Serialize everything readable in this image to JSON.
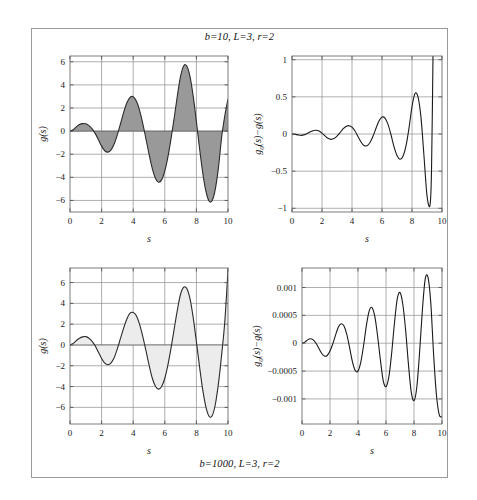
{
  "figure": {
    "title_top": "b=10, L=3, r=2",
    "title_bottom": "b=1000, L=3, r=2",
    "background": "#ffffff",
    "frame_color": "#9a9a9a"
  },
  "chart_data": [
    {
      "id": "top-left",
      "type": "area",
      "title": "b=10, L=3, r=2",
      "xlabel": "s",
      "ylabel": "g(s)",
      "xlim": [
        0,
        10
      ],
      "ylim": [
        -7,
        6.5
      ],
      "xticks": [
        0,
        2,
        4,
        6,
        8,
        10
      ],
      "yticks": [
        -6,
        -4,
        -2,
        0,
        2,
        4,
        6
      ],
      "xticklabels": [
        "0",
        "2",
        "4",
        "6",
        "8",
        "10"
      ],
      "yticklabels": [
        "-6",
        "-4",
        "-2",
        "0",
        "2",
        "4",
        "6"
      ],
      "grid": true,
      "fill_color": "#999999",
      "line_color": "#2b2b2b",
      "baseline": 0,
      "x": [
        0.0,
        0.2,
        0.4,
        0.6,
        0.8,
        1.0,
        1.2,
        1.4,
        1.6,
        1.8,
        2.0,
        2.2,
        2.4,
        2.6,
        2.8,
        3.0,
        3.2,
        3.4,
        3.6,
        3.8,
        4.0,
        4.2,
        4.4,
        4.6,
        4.8,
        5.0,
        5.2,
        5.4,
        5.6,
        5.8,
        6.0,
        6.2,
        6.4,
        6.6,
        6.8,
        7.0,
        7.2,
        7.4,
        7.6,
        7.8,
        8.0,
        8.2,
        8.4,
        8.6,
        8.8,
        9.0,
        9.2,
        9.4,
        9.6,
        9.8,
        10.0
      ],
      "y": [
        0.0,
        0.12,
        0.37,
        0.57,
        0.65,
        0.63,
        0.47,
        0.19,
        -0.22,
        -0.75,
        -1.3,
        -1.7,
        -1.82,
        -1.62,
        -1.1,
        -0.3,
        0.66,
        1.64,
        2.45,
        2.92,
        2.98,
        2.6,
        1.82,
        0.7,
        -0.62,
        -1.98,
        -3.2,
        -4.05,
        -4.42,
        -4.22,
        -3.45,
        -2.2,
        -0.6,
        1.2,
        3.1,
        4.75,
        5.65,
        5.62,
        4.7,
        3.0,
        0.82,
        -1.5,
        -3.6,
        -5.2,
        -6.05,
        -6.0,
        -5.0,
        -3.1,
        -0.5,
        1.35,
        2.78
      ]
    },
    {
      "id": "top-right",
      "type": "line",
      "title": "b=10, L=3, r=2",
      "xlabel": "s",
      "ylabel": "g0(s)-g(s)",
      "ylabel_parts": {
        "g": "g",
        "sub": "0",
        "rest": "(s)-g(s)"
      },
      "xlim": [
        0,
        10
      ],
      "ylim": [
        -1.05,
        1.05
      ],
      "xticks": [
        0,
        2,
        4,
        6,
        8,
        10
      ],
      "yticks": [
        -1,
        -0.5,
        0,
        0.5,
        1
      ],
      "xticklabels": [
        "0",
        "2",
        "4",
        "6",
        "8",
        "10"
      ],
      "yticklabels": [
        "-1",
        "-0.5",
        "0",
        "0.5",
        "1"
      ],
      "grid": true,
      "line_color": "#1a1a1a",
      "x": [
        0.0,
        0.2,
        0.4,
        0.6,
        0.8,
        1.0,
        1.2,
        1.4,
        1.6,
        1.8,
        2.0,
        2.2,
        2.4,
        2.6,
        2.8,
        3.0,
        3.2,
        3.4,
        3.6,
        3.8,
        4.0,
        4.2,
        4.4,
        4.6,
        4.8,
        5.0,
        5.2,
        5.4,
        5.6,
        5.8,
        6.0,
        6.2,
        6.4,
        6.6,
        6.8,
        7.0,
        7.2,
        7.4,
        7.6,
        7.8,
        8.0,
        8.2,
        8.4,
        8.6,
        8.8,
        9.0,
        9.2,
        9.3,
        9.4
      ],
      "y": [
        0.0,
        -0.004,
        -0.012,
        -0.018,
        -0.012,
        0.006,
        0.028,
        0.045,
        0.05,
        0.04,
        0.012,
        -0.025,
        -0.058,
        -0.072,
        -0.062,
        -0.03,
        0.018,
        0.068,
        0.102,
        0.112,
        0.092,
        0.04,
        -0.035,
        -0.108,
        -0.155,
        -0.158,
        -0.115,
        -0.03,
        0.078,
        0.175,
        0.228,
        0.215,
        0.13,
        -0.01,
        -0.17,
        -0.29,
        -0.34,
        -0.3,
        -0.16,
        0.08,
        0.37,
        0.545,
        0.5,
        0.22,
        -0.3,
        -0.83,
        -0.96,
        -0.5,
        1.05
      ]
    },
    {
      "id": "bottom-left",
      "type": "area",
      "title": "b=1000, L=3, r=2",
      "xlabel": "s",
      "ylabel": "g(s)",
      "xlim": [
        0,
        10
      ],
      "ylim": [
        -7.6,
        7.4
      ],
      "xticks": [
        0,
        2,
        4,
        6,
        8,
        10
      ],
      "yticks": [
        -6,
        -4,
        -2,
        0,
        2,
        4,
        6
      ],
      "xticklabels": [
        "0",
        "2",
        "4",
        "6",
        "8",
        "10"
      ],
      "yticklabels": [
        "-6",
        "-4",
        "-2",
        "0",
        "2",
        "4",
        "6"
      ],
      "grid": true,
      "fill_color": "#ececec",
      "line_color": "#2b2b2b",
      "baseline": 0,
      "x": [
        0.0,
        0.2,
        0.4,
        0.6,
        0.8,
        1.0,
        1.2,
        1.4,
        1.6,
        1.8,
        2.0,
        2.2,
        2.4,
        2.6,
        2.8,
        3.0,
        3.2,
        3.4,
        3.6,
        3.8,
        4.0,
        4.2,
        4.4,
        4.6,
        4.8,
        5.0,
        5.2,
        5.4,
        5.6,
        5.8,
        6.0,
        6.2,
        6.4,
        6.6,
        6.8,
        7.0,
        7.2,
        7.4,
        7.6,
        7.8,
        8.0,
        8.2,
        8.4,
        8.6,
        8.8,
        9.0,
        9.2,
        9.4,
        9.6,
        9.8,
        10.0
      ],
      "y": [
        0.0,
        0.15,
        0.42,
        0.65,
        0.78,
        0.8,
        0.65,
        0.35,
        -0.1,
        -0.7,
        -1.3,
        -1.75,
        -1.9,
        -1.72,
        -1.2,
        -0.35,
        0.65,
        1.65,
        2.5,
        3.05,
        3.13,
        2.8,
        2.0,
        0.85,
        -0.5,
        -1.9,
        -3.15,
        -3.95,
        -4.25,
        -4.0,
        -3.2,
        -1.9,
        -0.25,
        1.6,
        3.4,
        4.9,
        5.55,
        5.4,
        4.4,
        2.6,
        0.3,
        -2.1,
        -4.3,
        -5.95,
        -6.85,
        -6.8,
        -5.7,
        -3.65,
        -0.9,
        2.3,
        7.2
      ]
    },
    {
      "id": "bottom-right",
      "type": "line",
      "title": "b=1000, L=3, r=2",
      "xlabel": "s",
      "ylabel": "g0(s)-g(s)",
      "ylabel_parts": {
        "g": "g",
        "sub": "0",
        "rest": "(s)-g(s)"
      },
      "xlim": [
        0,
        10
      ],
      "ylim": [
        -0.00145,
        0.00135
      ],
      "xticks": [
        0,
        2,
        4,
        6,
        8,
        10
      ],
      "yticks": [
        -0.001,
        -0.0005,
        0,
        0.0005,
        0.001
      ],
      "xticklabels": [
        "0",
        "2",
        "4",
        "6",
        "8",
        "10"
      ],
      "yticklabels": [
        "-0.001",
        "-0.0005",
        "0",
        "0.0005",
        "0.001"
      ],
      "grid": true,
      "line_color": "#1a1a1a",
      "x": [
        0.0,
        0.2,
        0.4,
        0.6,
        0.8,
        1.0,
        1.2,
        1.4,
        1.6,
        1.8,
        2.0,
        2.2,
        2.4,
        2.6,
        2.8,
        3.0,
        3.2,
        3.4,
        3.6,
        3.8,
        4.0,
        4.2,
        4.4,
        4.6,
        4.8,
        5.0,
        5.2,
        5.4,
        5.6,
        5.8,
        6.0,
        6.2,
        6.4,
        6.6,
        6.8,
        7.0,
        7.2,
        7.4,
        7.6,
        7.8,
        8.0,
        8.2,
        8.4,
        8.6,
        8.8,
        9.0,
        9.2,
        9.4,
        9.6,
        9.8,
        10.0
      ],
      "y": [
        0.0,
        2e-05,
        6e-05,
        8e-05,
        6e-05,
        0.0,
        -9e-05,
        -0.00018,
        -0.00023,
        -0.00022,
        -0.00014,
        -1e-05,
        0.00015,
        0.00029,
        0.00035,
        0.00031,
        0.00016,
        -8e-05,
        -0.00033,
        -0.00049,
        -0.0005,
        -0.00034,
        -4e-05,
        0.00032,
        0.00058,
        0.00064,
        0.00048,
        0.00013,
        -0.0003,
        -0.00067,
        -0.00078,
        -0.00061,
        -0.00019,
        0.00035,
        0.00079,
        0.00091,
        0.0007,
        0.00024,
        -0.00037,
        -0.00087,
        -0.00103,
        -0.00079,
        -0.00016,
        0.0006,
        0.00115,
        0.00118,
        0.00072,
        -0.0002,
        -0.00092,
        -0.00128,
        -0.00132
      ]
    }
  ]
}
